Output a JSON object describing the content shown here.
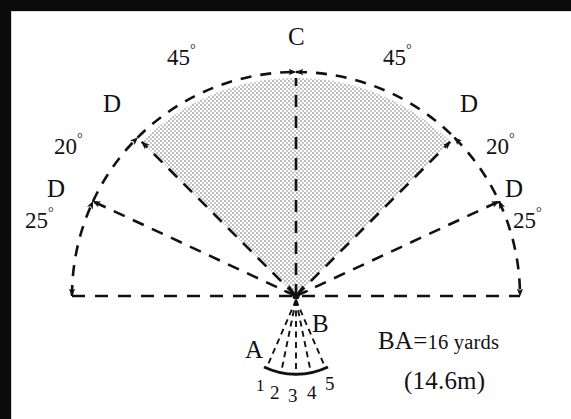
{
  "diagram": {
    "center_point_label": "B",
    "apex_label": "C",
    "inner_arc_label": "A",
    "boundary_labels": [
      "D",
      "D",
      "D",
      "D"
    ],
    "angles": {
      "left_outer": "45",
      "right_outer": "45",
      "left_mid": "20",
      "right_mid": "20",
      "left_inner": "25",
      "right_inner": "25",
      "degree_symbol": "°"
    },
    "fan_numbers": [
      "1",
      "2",
      "3",
      "4",
      "5"
    ],
    "notes": {
      "line1_prefix": "BA",
      "line1_equals": "=",
      "line1_value": "16 yards",
      "line2": "(14.6m)"
    },
    "colors": {
      "ink": "#111111",
      "border": "#0b0b0b",
      "shade_fill": "#cfcfcf",
      "paper": "#ffffff"
    },
    "geometry": {
      "center_x": 296,
      "center_y": 296,
      "outer_radius": 224,
      "sector_radius": 218,
      "inner_fan_radius": 74
    }
  }
}
